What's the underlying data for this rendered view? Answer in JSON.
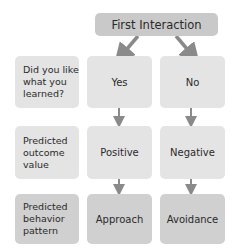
{
  "header": {
    "title": "First Interaction"
  },
  "rows": [
    {
      "label": "Did you like what you learned?",
      "left": "Yes",
      "right": "No"
    },
    {
      "label": "Predicted outcome value",
      "left": "Positive",
      "right": "Negative"
    },
    {
      "label": "Predicted behavior pattern",
      "left": "Approach",
      "right": "Avoidance"
    }
  ],
  "colors": {
    "arrow": "#8a8a8a",
    "box_light": "#e4e4e4",
    "box_mid": "#d0d0d0",
    "header": "#c9c9c9"
  }
}
